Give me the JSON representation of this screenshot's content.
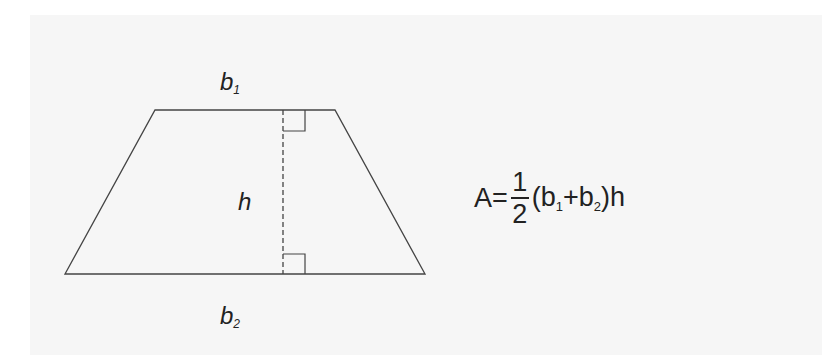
{
  "diagram": {
    "shape": "trapezoid",
    "labels": {
      "top_base": {
        "base": "b",
        "sub": "1"
      },
      "bottom_base": {
        "base": "b",
        "sub": "2"
      },
      "height": "h"
    },
    "formula": {
      "lhs": "A=",
      "numerator": "1",
      "denominator": "2",
      "open": "(b",
      "sub1": "1",
      "plus": "+b",
      "sub2": "2",
      "close": ")h"
    },
    "colors": {
      "line": "#333333",
      "text": "#222222",
      "background": "#f6f6f6"
    }
  }
}
